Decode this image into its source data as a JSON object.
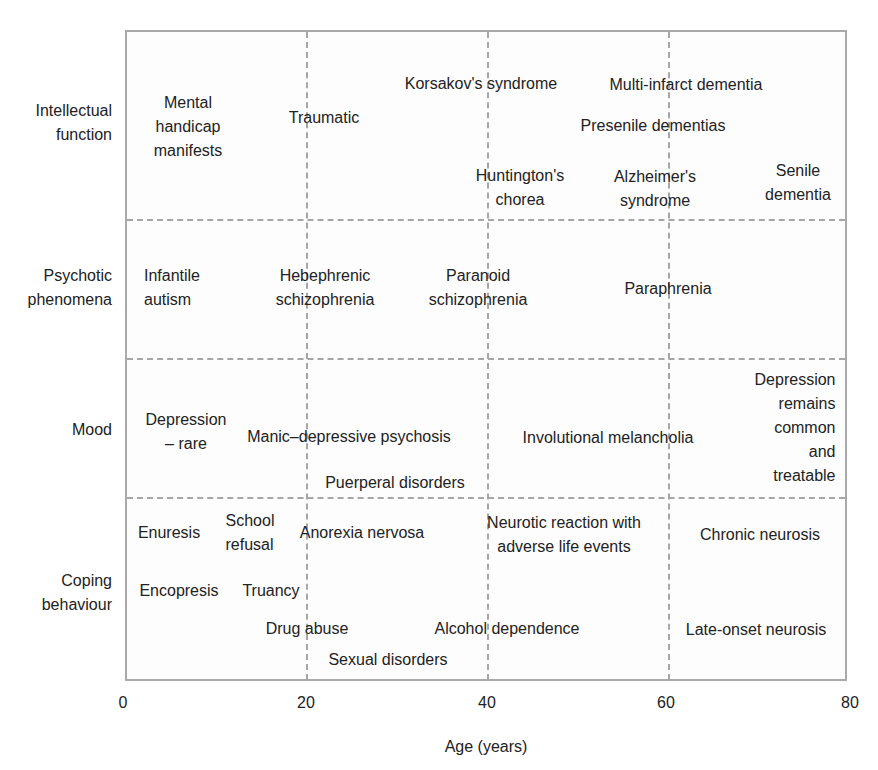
{
  "diagram": {
    "type": "grid-diagram",
    "x_axis": {
      "label": "Age (years)",
      "ticks": [
        "0",
        "20",
        "40",
        "60",
        "80"
      ],
      "range": [
        0,
        80
      ]
    },
    "rows": [
      {
        "label": "Intellectual\nfunction",
        "items": [
          {
            "text": "Mental\nhandicap\nmanifests"
          },
          {
            "text": "Traumatic"
          },
          {
            "text": "Korsakov's syndrome"
          },
          {
            "text": "Multi-infarct dementia"
          },
          {
            "text": "Presenile dementias"
          },
          {
            "text": "Huntington's\nchorea"
          },
          {
            "text": "Alzheimer's\nsyndrome"
          },
          {
            "text": "Senile\ndementia"
          }
        ]
      },
      {
        "label": "Psychotic\nphenomena",
        "items": [
          {
            "text": "Infantile\nautism"
          },
          {
            "text": "Hebephrenic\nschizophrenia"
          },
          {
            "text": "Paranoid\nschizophrenia"
          },
          {
            "text": "Paraphrenia"
          }
        ]
      },
      {
        "label": "Mood",
        "items": [
          {
            "text": "Depression\n– rare"
          },
          {
            "text": "Manic–depressive psychosis"
          },
          {
            "text": "Puerperal disorders"
          },
          {
            "text": "Involutional melancholia"
          },
          {
            "text": "Depression\nremains\ncommon and\ntreatable"
          }
        ]
      },
      {
        "label": "Coping\nbehaviour",
        "items": [
          {
            "text": "Enuresis"
          },
          {
            "text": "School\nrefusal"
          },
          {
            "text": "Anorexia nervosa"
          },
          {
            "text": "Neurotic reaction with\nadverse life events"
          },
          {
            "text": "Chronic neurosis"
          },
          {
            "text": "Encopresis"
          },
          {
            "text": "Truancy"
          },
          {
            "text": "Drug abuse"
          },
          {
            "text": "Alcohol dependence"
          },
          {
            "text": "Late-onset neurosis"
          },
          {
            "text": "Sexual disorders"
          }
        ]
      }
    ]
  },
  "colors": {
    "text": "#222222",
    "grid": "#a6a6a6",
    "frame": "#a9a9a9"
  }
}
